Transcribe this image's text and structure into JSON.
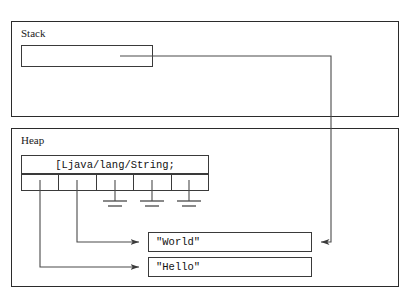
{
  "diagram": {
    "title_regions": {
      "stack_label": "Stack",
      "heap_label": "Heap"
    },
    "stack": {
      "slot_value": "",
      "slot_note": "reference to String array"
    },
    "heap": {
      "array": {
        "type_descriptor": "[Ljava/lang/String;",
        "length": 5,
        "cells": [
          {
            "index": 0,
            "value": "ref",
            "target": "Hello"
          },
          {
            "index": 1,
            "value": "ref",
            "target": "World"
          },
          {
            "index": 2,
            "value": "null",
            "target": null
          },
          {
            "index": 3,
            "value": "null",
            "target": null
          },
          {
            "index": 4,
            "value": "null",
            "target": null
          }
        ]
      },
      "objects": [
        {
          "id": "world",
          "text": "\"World\""
        },
        {
          "id": "hello",
          "text": "\"Hello\""
        }
      ]
    },
    "colors": {
      "region_border": "#2b2b2b",
      "box_border": "#3a3a3a",
      "wire": "#4a4a4a",
      "text": "#111111",
      "background": "#ffffff"
    }
  }
}
